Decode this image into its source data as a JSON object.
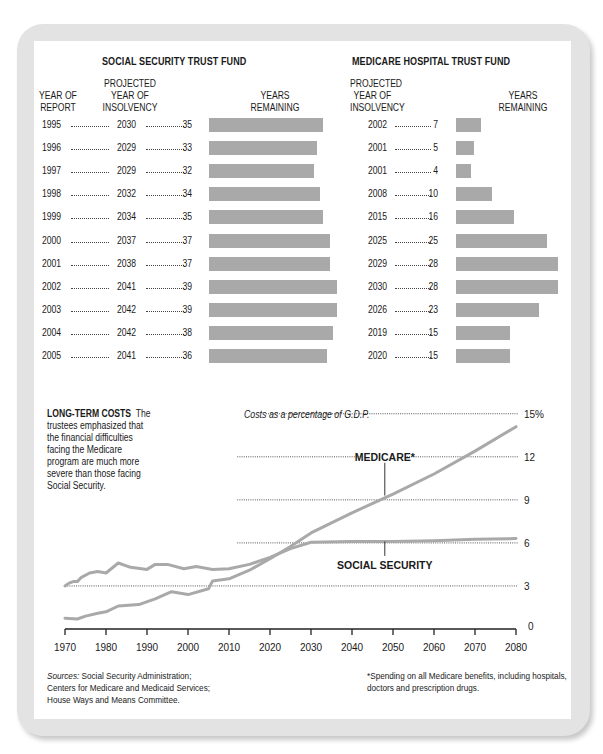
{
  "social_security": {
    "title": "SOCIAL SECURITY TRUST FUND",
    "headers": {
      "year_of_report": [
        "YEAR OF",
        "REPORT"
      ],
      "projected": [
        "PROJECTED",
        "YEAR OF",
        "INSOLVENCY"
      ],
      "remaining": [
        "YEARS",
        "REMAINING"
      ]
    },
    "rows": [
      {
        "report": "1995",
        "insolvency": "2030",
        "remaining": 35
      },
      {
        "report": "1996",
        "insolvency": "2029",
        "remaining": 33
      },
      {
        "report": "1997",
        "insolvency": "2029",
        "remaining": 32
      },
      {
        "report": "1998",
        "insolvency": "2032",
        "remaining": 34
      },
      {
        "report": "1999",
        "insolvency": "2034",
        "remaining": 35
      },
      {
        "report": "2000",
        "insolvency": "2037",
        "remaining": 37
      },
      {
        "report": "2001",
        "insolvency": "2038",
        "remaining": 37
      },
      {
        "report": "2002",
        "insolvency": "2041",
        "remaining": 39
      },
      {
        "report": "2003",
        "insolvency": "2042",
        "remaining": 39
      },
      {
        "report": "2004",
        "insolvency": "2042",
        "remaining": 38
      },
      {
        "report": "2005",
        "insolvency": "2041",
        "remaining": 36
      }
    ]
  },
  "medicare_hospital": {
    "title": "MEDICARE HOSPITAL TRUST FUND",
    "headers": {
      "projected": [
        "PROJECTED",
        "YEAR OF",
        "INSOLVENCY"
      ],
      "remaining": [
        "YEARS",
        "REMAINING"
      ]
    },
    "rows": [
      {
        "insolvency": "2002",
        "remaining": 7
      },
      {
        "insolvency": "2001",
        "remaining": 5
      },
      {
        "insolvency": "2001",
        "remaining": 4
      },
      {
        "insolvency": "2008",
        "remaining": 10
      },
      {
        "insolvency": "2015",
        "remaining": 16
      },
      {
        "insolvency": "2025",
        "remaining": 25
      },
      {
        "insolvency": "2029",
        "remaining": 28
      },
      {
        "insolvency": "2030",
        "remaining": 28
      },
      {
        "insolvency": "2026",
        "remaining": 23
      },
      {
        "insolvency": "2019",
        "remaining": 15
      },
      {
        "insolvency": "2020",
        "remaining": 15
      }
    ]
  },
  "long_term": {
    "title": "LONG-TERM COSTS",
    "description_lines": [
      "The",
      "trustees emphasized that",
      "the financial difficulties",
      "facing the Medicare",
      "program are much more",
      "severe than those facing",
      "Social Security."
    ],
    "axis_caption": "Costs as a percentage of G.D.P.",
    "medicare_label": "MEDICARE*",
    "ss_label": "SOCIAL SECURITY"
  },
  "footer": {
    "sources_label": "Sources:",
    "sources_lines": [
      " Social Security Administration;",
      "Centers for Medicare and Medicaid Services;",
      "House Ways and Means Committee."
    ],
    "footnote_lines": [
      "*Spending on all Medicare benefits, including hospitals,",
      "doctors and prescription drugs."
    ]
  },
  "colors": {
    "bar": "#a9a9a9",
    "line": "#a9a9a9",
    "frame": "#e3e3e3",
    "text": "#1a1a1a"
  },
  "chart_data": [
    {
      "type": "bar",
      "title": "SOCIAL SECURITY TRUST FUND",
      "orientation": "horizontal",
      "categories": [
        "1995",
        "1996",
        "1997",
        "1998",
        "1999",
        "2000",
        "2001",
        "2002",
        "2003",
        "2004",
        "2005"
      ],
      "xlabel": "YEARS REMAINING",
      "ylabel": "YEAR OF REPORT",
      "series": [
        {
          "name": "Years remaining",
          "values": [
            35,
            33,
            32,
            34,
            35,
            37,
            37,
            39,
            39,
            38,
            36
          ]
        },
        {
          "name": "Projected year of insolvency",
          "values": [
            2030,
            2029,
            2029,
            2032,
            2034,
            2037,
            2038,
            2041,
            2042,
            2042,
            2041
          ]
        }
      ]
    },
    {
      "type": "bar",
      "title": "MEDICARE HOSPITAL TRUST FUND",
      "orientation": "horizontal",
      "categories": [
        "1995",
        "1996",
        "1997",
        "1998",
        "1999",
        "2000",
        "2001",
        "2002",
        "2003",
        "2004",
        "2005"
      ],
      "xlabel": "YEARS REMAINING",
      "series": [
        {
          "name": "Years remaining",
          "values": [
            7,
            5,
            4,
            10,
            16,
            25,
            28,
            28,
            23,
            15,
            15
          ]
        },
        {
          "name": "Projected year of insolvency",
          "values": [
            2002,
            2001,
            2001,
            2008,
            2015,
            2025,
            2029,
            2030,
            2026,
            2019,
            2020
          ]
        }
      ]
    },
    {
      "type": "line",
      "title": "LONG-TERM COSTS",
      "ylabel": "Costs as a percentage of G.D.P.",
      "xlim": [
        1970,
        2080
      ],
      "ylim": [
        0,
        15
      ],
      "xticks": [
        1970,
        1980,
        1990,
        2000,
        2010,
        2020,
        2030,
        2040,
        2050,
        2060,
        2070,
        2080
      ],
      "yticks": [
        0,
        3,
        6,
        9,
        12,
        15
      ],
      "ytick_labels": [
        "0",
        "3",
        "6",
        "9",
        "12",
        "15%"
      ],
      "grid": "dotted horizontal at 3,6,9,12,15",
      "series": [
        {
          "name": "SOCIAL SECURITY",
          "x": [
            1970,
            1971,
            1972,
            1973,
            1974,
            1976,
            1978,
            1980,
            1983,
            1986,
            1990,
            1992,
            1995,
            1999,
            2002,
            2006,
            2010,
            2015,
            2020,
            2025,
            2030,
            2040,
            2050,
            2060,
            2070,
            2080
          ],
          "y": [
            3.0,
            3.2,
            3.3,
            3.3,
            3.6,
            3.9,
            4.0,
            3.9,
            4.6,
            4.3,
            4.15,
            4.5,
            4.5,
            4.2,
            4.35,
            4.15,
            4.2,
            4.5,
            5.0,
            5.6,
            6.05,
            6.1,
            6.1,
            6.15,
            6.25,
            6.3
          ]
        },
        {
          "name": "MEDICARE*",
          "x": [
            1970,
            1973,
            1975,
            1978,
            1980,
            1983,
            1988,
            1992,
            1996,
            2000,
            2005,
            2006,
            2010,
            2015,
            2020,
            2025,
            2030,
            2040,
            2050,
            2060,
            2070,
            2080
          ],
          "y": [
            0.75,
            0.7,
            0.9,
            1.1,
            1.2,
            1.6,
            1.7,
            2.1,
            2.6,
            2.4,
            2.8,
            3.35,
            3.5,
            4.1,
            4.9,
            5.75,
            6.7,
            8.1,
            9.4,
            10.8,
            12.4,
            14.1
          ]
        }
      ]
    }
  ]
}
